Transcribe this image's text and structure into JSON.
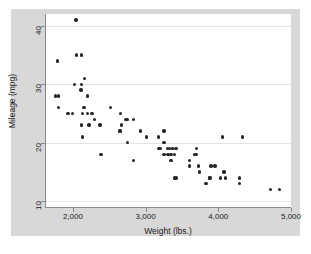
{
  "chart_data": {
    "type": "scatter",
    "title": "",
    "xlabel": "Weight (lbs.)",
    "ylabel": "Mileage (mpg)",
    "xlim": [
      1630,
      5000
    ],
    "ylim": [
      9,
      42
    ],
    "xticks": [
      2000,
      3000,
      4000,
      5000
    ],
    "xtick_labels": [
      "2,000",
      "3,000",
      "4,000",
      "5,000"
    ],
    "yticks": [
      10,
      20,
      30,
      40
    ],
    "ytick_labels": [
      "10",
      "20",
      "30",
      "40"
    ],
    "grid": "horizontal",
    "legend": "none",
    "marker": {
      "shape": "circle",
      "color": "#26262b",
      "size": 3
    },
    "series": [
      {
        "name": "Mileage vs Weight",
        "points": [
          [
            2930,
            22
          ],
          [
            3350,
            17
          ],
          [
            2640,
            22
          ],
          [
            3250,
            20
          ],
          [
            4080,
            15
          ],
          [
            3670,
            18
          ],
          [
            3880,
            14
          ],
          [
            3400,
            14
          ],
          [
            3015,
            21
          ],
          [
            4030,
            14
          ],
          [
            3180,
            21
          ],
          [
            4060,
            21
          ],
          [
            3700,
            19
          ],
          [
            3955,
            16
          ],
          [
            3830,
            13
          ],
          [
            4290,
            14
          ],
          [
            4330,
            21
          ],
          [
            3900,
            16
          ],
          [
            4290,
            13
          ],
          [
            2110,
            29
          ],
          [
            2200,
            28
          ],
          [
            2150,
            26
          ],
          [
            1800,
            28
          ],
          [
            1790,
            34
          ],
          [
            2385,
            18
          ],
          [
            2520,
            26
          ],
          [
            2300,
            24
          ],
          [
            2655,
            25
          ],
          [
            3690,
            18
          ],
          [
            3180,
            19
          ],
          [
            3370,
            19
          ],
          [
            2730,
            24
          ],
          [
            2830,
            17
          ],
          [
            2130,
            21
          ],
          [
            2650,
            22
          ],
          [
            3250,
            18
          ],
          [
            4100,
            14
          ],
          [
            3420,
            14
          ],
          [
            3885,
            14
          ],
          [
            1800,
            26
          ],
          [
            1760,
            28
          ],
          [
            2050,
            35
          ],
          [
            2120,
            35
          ],
          [
            2020,
            30
          ],
          [
            2120,
            30
          ],
          [
            2160,
            31
          ],
          [
            2040,
            41
          ],
          [
            2260,
            25
          ],
          [
            2130,
            25
          ],
          [
            1930,
            25
          ],
          [
            1990,
            25
          ],
          [
            2200,
            25
          ],
          [
            2670,
            23
          ],
          [
            2370,
            23
          ],
          [
            2220,
            23
          ],
          [
            2120,
            23
          ],
          [
            3600,
            17
          ],
          [
            3330,
            19
          ],
          [
            3300,
            19
          ],
          [
            3370,
            19
          ],
          [
            3420,
            19
          ],
          [
            3200,
            19
          ],
          [
            3310,
            18
          ],
          [
            3350,
            18
          ],
          [
            3400,
            18
          ],
          [
            3250,
            22
          ],
          [
            2750,
            20
          ],
          [
            3600,
            16
          ],
          [
            3730,
            16
          ],
          [
            3740,
            15
          ],
          [
            2830,
            24
          ],
          [
            2750,
            24
          ],
          [
            4720,
            12
          ],
          [
            4840,
            12
          ]
        ]
      }
    ]
  },
  "axes": {
    "y_title": "Mileage (mpg)",
    "x_title": "Weight (lbs.)",
    "y_tick_labels": [
      "10",
      "20",
      "30",
      "40"
    ],
    "x_tick_labels": [
      "2,000",
      "3,000",
      "4,000",
      "5,000"
    ]
  },
  "colors": {
    "outer_background": "#ffffff",
    "graph_region": "#d8d8d8",
    "plot_panel": "#ffffff",
    "gridline": "#e4e4e4",
    "axis_line": "#8a8a8a",
    "marker": "#26262b",
    "text": "#1b1b1b"
  }
}
